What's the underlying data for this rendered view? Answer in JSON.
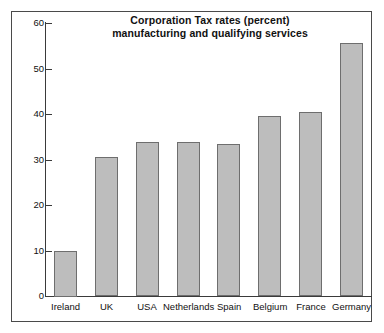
{
  "chart_data": {
    "type": "bar",
    "title": "Corporation Tax rates (percent) manufacturing and qualifying services",
    "title_lines": [
      "Corporation Tax rates (percent)",
      "manufacturing and qualifying services"
    ],
    "xlabel": "",
    "ylabel": "",
    "ylim": [
      0,
      60
    ],
    "ytick_values": [
      0,
      10,
      20,
      30,
      40,
      50,
      60
    ],
    "ytick_labels": [
      "0",
      "10",
      "20",
      "30",
      "40",
      "50",
      "60"
    ],
    "grid": false,
    "legend": false,
    "categories": [
      "Ireland",
      "UK",
      "USA",
      "Netherlands",
      "Spain",
      "Belgium",
      "France",
      "Germany"
    ],
    "values": [
      10,
      30.5,
      33.8,
      33.8,
      33.5,
      39.5,
      40.5,
      55.5
    ],
    "bar_color": "#bdbdbd",
    "bar_edge_color": "#6e6e6e",
    "axis_color": "#3a3a3a",
    "frame_color": "#4a4a4a",
    "background_color": "#ffffff",
    "text_color": "#111111"
  }
}
